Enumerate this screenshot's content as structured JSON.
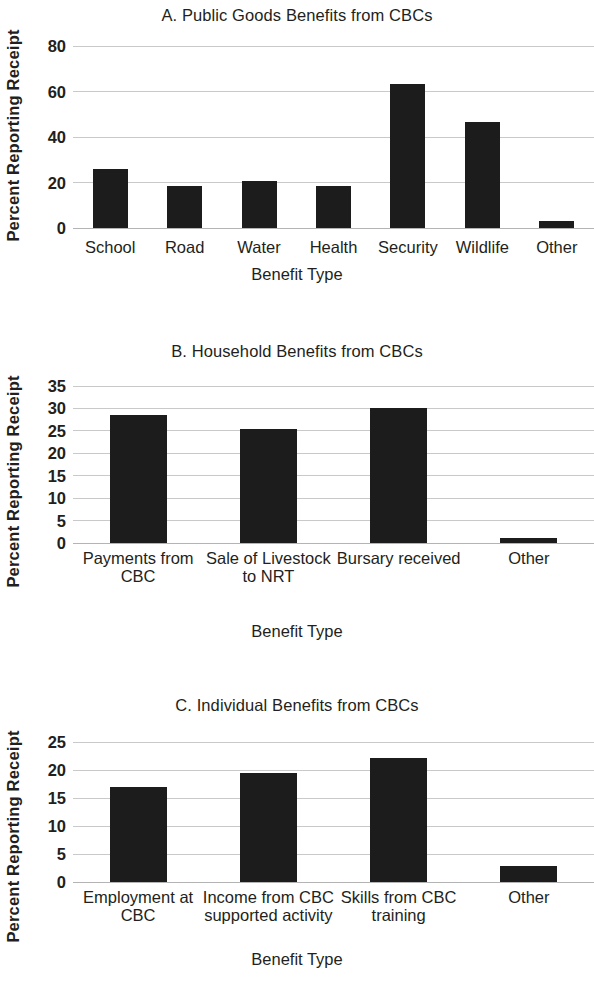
{
  "figure": {
    "axis_title_x": "Benefit Type",
    "axis_title_y": "Percent Reporting Receipt",
    "bar_color": "#1c1c1c",
    "gridline_color": "#c9c9c9"
  },
  "chart_data": [
    {
      "type": "bar",
      "panel": "A",
      "title": "A. Public Goods Benefits from CBCs",
      "xlabel": "Benefit Type",
      "ylabel": "Percent Reporting Receipt",
      "categories": [
        "School",
        "Road",
        "Water",
        "Health",
        "Security",
        "Wildlife",
        "Other"
      ],
      "values": [
        26.0,
        18.5,
        20.8,
        18.4,
        63.5,
        46.5,
        3.0
      ],
      "ylim": [
        0,
        80
      ],
      "yticks": [
        0,
        20,
        40,
        60,
        80
      ],
      "grid": true,
      "legend": "none"
    },
    {
      "type": "bar",
      "panel": "B",
      "title": "B. Household Benefits from CBCs",
      "xlabel": "Benefit Type",
      "ylabel": "Percent Reporting Receipt",
      "categories": [
        "Payments from CBC",
        "Sale of Livestock to NRT",
        "Bursary received",
        "Other"
      ],
      "values": [
        28.5,
        25.4,
        30.1,
        1.2
      ],
      "ylim": [
        0,
        35
      ],
      "yticks": [
        0,
        5,
        10,
        15,
        20,
        25,
        30,
        35
      ],
      "grid": true,
      "legend": "none"
    },
    {
      "type": "bar",
      "panel": "C",
      "title": "C. Individual Benefits from CBCs",
      "xlabel": "Benefit Type",
      "ylabel": "Percent Reporting Receipt",
      "categories": [
        "Employment at CBC",
        "Income from CBC supported activity",
        "Skills from CBC training",
        "Other"
      ],
      "values": [
        17.0,
        19.5,
        22.2,
        2.8
      ],
      "ylim": [
        0,
        25
      ],
      "yticks": [
        0,
        5,
        10,
        15,
        20,
        25
      ],
      "grid": true,
      "legend": "none"
    }
  ]
}
